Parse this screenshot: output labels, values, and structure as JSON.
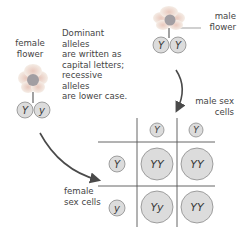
{
  "labels": {
    "female_flower": [
      "female",
      "flower"
    ],
    "male_flower": [
      "male",
      "flower"
    ],
    "note": [
      "Dominant alleles",
      "are written as",
      "capital letters;",
      "recessive alleles",
      "are lower case."
    ],
    "male_sex_cells": [
      "male sex",
      "cells"
    ],
    "female_sex_cells": [
      "female",
      "sex cells"
    ]
  },
  "female_parent": {
    "alleles": [
      "Y",
      "y"
    ]
  },
  "male_parent": {
    "alleles": [
      "Y",
      "Y"
    ]
  },
  "punnett": {
    "columns": [
      "Y",
      "Y"
    ],
    "rows": [
      "Y",
      "y"
    ],
    "cells": [
      [
        "YY",
        "YY"
      ],
      [
        "Yy",
        "YY"
      ]
    ]
  },
  "colors": {
    "circle_fill": "#dcdcdc",
    "circle_stroke": "#8a8a8a",
    "grid_line": "#555555",
    "arrow": "#4a4a4a",
    "petal": "#f2e6dd",
    "flower_center": "#a29ea2",
    "stem": "#7a7a7a"
  }
}
